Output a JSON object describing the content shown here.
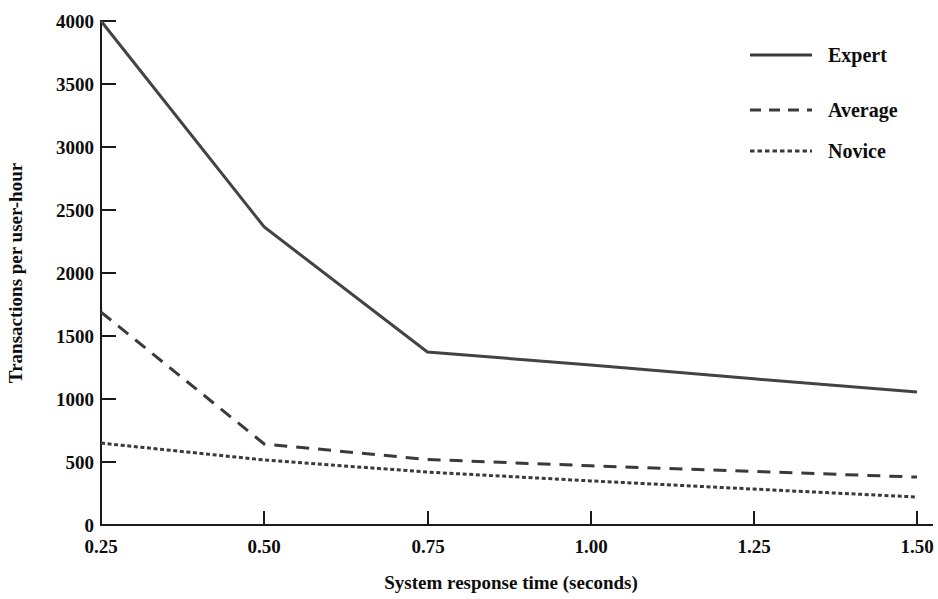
{
  "chart_data": {
    "type": "line",
    "title": "",
    "subtitle": "",
    "xlabel": "System response time (seconds)",
    "ylabel": "Transactions per user-hour",
    "x": [
      0.25,
      0.5,
      0.75,
      1.0,
      1.25,
      1.5
    ],
    "xticklabels": [
      "0.25",
      "0.50",
      "0.75",
      "1.00",
      "1.25",
      "1.50"
    ],
    "yticks": [
      0,
      500,
      1000,
      1500,
      2000,
      2500,
      3000,
      3500,
      4000
    ],
    "yticklabels": [
      "0",
      "500",
      "1000",
      "1500",
      "2000",
      "2500",
      "3000",
      "3500",
      "4000"
    ],
    "xlim": [
      0.25,
      1.5
    ],
    "ylim": [
      0,
      4000
    ],
    "grid": false,
    "legend_position": "top-right",
    "series": [
      {
        "name": "Expert",
        "linestyle": "solid",
        "color": "#434345",
        "values": [
          4000,
          2365,
          1373,
          1270,
          1160,
          1055
        ]
      },
      {
        "name": "Average",
        "linestyle": "dashed",
        "color": "#3a3a3c",
        "values": [
          1690,
          643,
          520,
          470,
          425,
          380
        ]
      },
      {
        "name": "Novice",
        "linestyle": "dotted",
        "color": "#3a3a3c",
        "values": [
          650,
          516,
          420,
          350,
          285,
          222
        ]
      }
    ]
  },
  "axes": {
    "x_title": "System response time (seconds)",
    "y_title": "Transactions per user-hour"
  },
  "legend": {
    "entries": [
      {
        "label": "Expert"
      },
      {
        "label": "Average"
      },
      {
        "label": "Novice"
      }
    ]
  },
  "yticklabels": {
    "t0": "0",
    "t500": "500",
    "t1000": "1000",
    "t1500": "1500",
    "t2000": "2000",
    "t2500": "2500",
    "t3000": "3000",
    "t3500": "3500",
    "t4000": "4000"
  },
  "xticklabels": {
    "t025": "0.25",
    "t050": "0.50",
    "t075": "0.75",
    "t100": "1.00",
    "t125": "1.25",
    "t150": "1.50"
  }
}
